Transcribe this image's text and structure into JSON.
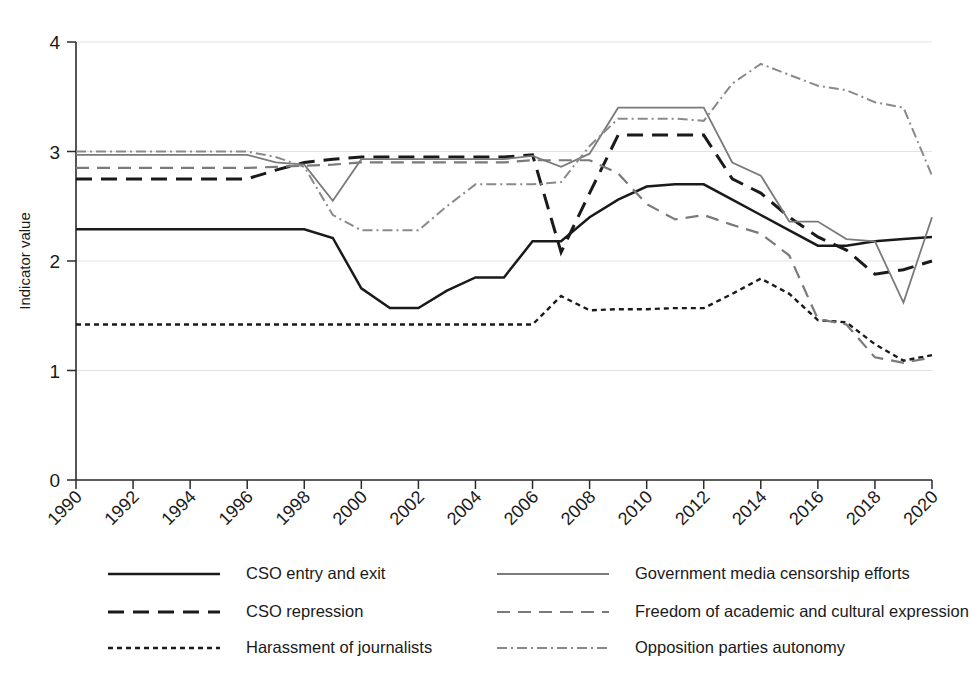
{
  "chart_data": {
    "type": "line",
    "title": "",
    "subtitle": "",
    "xlabel": "",
    "ylabel": "Indicator value",
    "xlim": [
      1990,
      2020
    ],
    "ylim": [
      0,
      4
    ],
    "yticks": [
      0,
      1,
      2,
      3,
      4
    ],
    "xticks": [
      1990,
      1992,
      1994,
      1996,
      1998,
      2000,
      2002,
      2004,
      2006,
      2008,
      2010,
      2012,
      2014,
      2016,
      2018,
      2020
    ],
    "xtick_labels": [
      "1990",
      "1992",
      "1994",
      "1996",
      "1998",
      "2000",
      "2002",
      "2004",
      "2006",
      "2008",
      "2010",
      "2012",
      "2014",
      "2016",
      "2018",
      "2020"
    ],
    "ytick_labels": [
      "0",
      "1",
      "2",
      "3",
      "4"
    ],
    "grid": true,
    "grid_axis": "y",
    "legend_position": "bottom",
    "legend_columns": 2,
    "x": [
      1990,
      1991,
      1992,
      1993,
      1994,
      1995,
      1996,
      1997,
      1998,
      1999,
      2000,
      2001,
      2002,
      2003,
      2004,
      2005,
      2006,
      2007,
      2008,
      2009,
      2010,
      2011,
      2012,
      2013,
      2014,
      2015,
      2016,
      2017,
      2018,
      2019,
      2020
    ],
    "series": [
      {
        "name": "CSO entry and exit",
        "style": "solid",
        "color": "#1a1a1a",
        "width": 2.5,
        "dash": "none",
        "values": [
          2.29,
          2.29,
          2.29,
          2.29,
          2.29,
          2.29,
          2.29,
          2.29,
          2.29,
          2.21,
          1.75,
          1.57,
          1.57,
          1.73,
          1.85,
          1.85,
          2.18,
          2.18,
          2.4,
          2.56,
          2.68,
          2.7,
          2.7,
          2.56,
          2.42,
          2.28,
          2.14,
          2.14,
          2.18,
          2.2,
          2.22
        ]
      },
      {
        "name": "CSO repression",
        "style": "dashed-long",
        "color": "#1a1a1a",
        "width": 3.0,
        "dash": "16,9",
        "values": [
          2.75,
          2.75,
          2.75,
          2.75,
          2.75,
          2.75,
          2.75,
          2.83,
          2.9,
          2.93,
          2.95,
          2.95,
          2.95,
          2.95,
          2.95,
          2.95,
          2.97,
          2.08,
          2.62,
          3.15,
          3.15,
          3.15,
          3.15,
          2.75,
          2.62,
          2.4,
          2.22,
          2.1,
          1.88,
          1.92,
          2.0
        ]
      },
      {
        "name": "Harassment of journalists",
        "style": "dotted",
        "color": "#1a1a1a",
        "width": 2.4,
        "dash": "5,4",
        "values": [
          1.42,
          1.42,
          1.42,
          1.42,
          1.42,
          1.42,
          1.42,
          1.42,
          1.42,
          1.42,
          1.42,
          1.42,
          1.42,
          1.42,
          1.42,
          1.42,
          1.42,
          1.68,
          1.55,
          1.56,
          1.56,
          1.57,
          1.57,
          1.7,
          1.84,
          1.7,
          1.46,
          1.44,
          1.24,
          1.09,
          1.14
        ]
      },
      {
        "name": "Government media censorship efforts",
        "style": "solid",
        "color": "#7a7a7a",
        "width": 1.8,
        "dash": "none",
        "values": [
          2.97,
          2.97,
          2.97,
          2.97,
          2.97,
          2.97,
          2.97,
          2.9,
          2.88,
          2.55,
          2.93,
          2.93,
          2.93,
          2.93,
          2.93,
          2.93,
          2.96,
          2.86,
          2.98,
          3.4,
          3.4,
          3.4,
          3.4,
          2.9,
          2.78,
          2.36,
          2.36,
          2.2,
          2.18,
          1.62,
          2.4
        ]
      },
      {
        "name": "Freedom of academic and cultural expression",
        "style": "dashed-medium",
        "color": "#7a7a7a",
        "width": 2.2,
        "dash": "13,8",
        "values": [
          2.85,
          2.85,
          2.85,
          2.85,
          2.85,
          2.85,
          2.85,
          2.86,
          2.87,
          2.88,
          2.9,
          2.9,
          2.9,
          2.9,
          2.9,
          2.9,
          2.92,
          2.92,
          2.92,
          2.8,
          2.52,
          2.38,
          2.42,
          2.33,
          2.25,
          2.05,
          1.47,
          1.42,
          1.12,
          1.07,
          1.12
        ]
      },
      {
        "name": "Opposition parties autonomy",
        "style": "dash-dot",
        "color": "#8a8a8a",
        "width": 2.0,
        "dash": "10,4,2,4",
        "values": [
          3.0,
          3.0,
          3.0,
          3.0,
          3.0,
          3.0,
          3.0,
          2.95,
          2.86,
          2.42,
          2.28,
          2.28,
          2.28,
          2.5,
          2.7,
          2.7,
          2.7,
          2.72,
          3.05,
          3.3,
          3.3,
          3.3,
          3.28,
          3.62,
          3.8,
          3.7,
          3.6,
          3.56,
          3.45,
          3.4,
          2.78
        ]
      }
    ]
  },
  "axis": {
    "ylabel": "Indicator value"
  },
  "legend": {
    "items": [
      {
        "label": "CSO entry and exit",
        "series_index": 0
      },
      {
        "label": "Government media censorship efforts",
        "series_index": 3
      },
      {
        "label": "CSO repression",
        "series_index": 1
      },
      {
        "label": "Freedom of academic and cultural expression",
        "series_index": 4
      },
      {
        "label": "Harassment of journalists",
        "series_index": 2
      },
      {
        "label": "Opposition parties autonomy",
        "series_index": 5
      }
    ]
  }
}
